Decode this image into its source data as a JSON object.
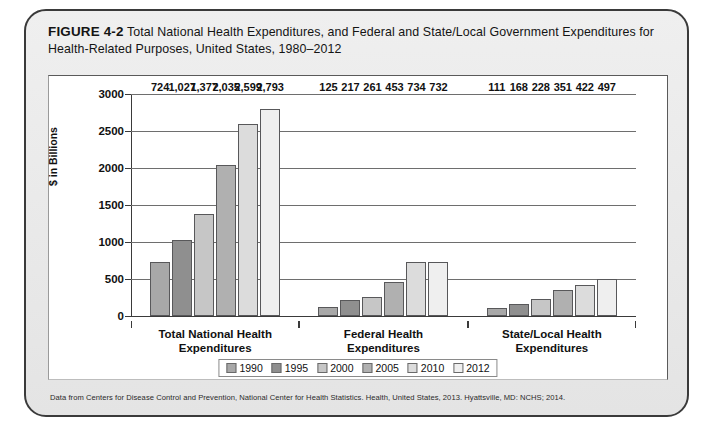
{
  "figure": {
    "label": "FIGURE 4-2",
    "caption": "Total National Health Expenditures, and Federal and State/Local Government Expenditures for Health-Related Purposes, United States, 1980–2012",
    "footnote": "Data from Centers for Disease Control and Prevention, National Center for Health Statistics. Health, United States, 2013. Hyattsville, MD: NCHS; 2014."
  },
  "chart_data": {
    "type": "bar",
    "title": "Total National Health Expenditures, and Federal and State/Local Government Expenditures for Health-Related Purposes, United States, 1980–2012",
    "xlabel": "",
    "ylabel": "$ in Billions",
    "ylim": [
      0,
      3000
    ],
    "yticks": [
      0,
      500,
      1000,
      1500,
      2000,
      2500,
      3000
    ],
    "ytick_labels": [
      "0",
      "500",
      "1000",
      "1500",
      "2000",
      "2500",
      "3000"
    ],
    "grid": true,
    "legend_position": "bottom",
    "categories": [
      "Total National Health Expenditures",
      "Federal Health Expenditures",
      "State/Local Health Expenditures"
    ],
    "series": [
      {
        "name": "1990",
        "color": "#a8a8a8",
        "values": [
          724,
          125,
          111
        ],
        "labels": [
          "724",
          "125",
          "111"
        ]
      },
      {
        "name": "1995",
        "color": "#8f8f8f",
        "values": [
          1027,
          217,
          168
        ],
        "labels": [
          "1,027",
          "217",
          "168"
        ]
      },
      {
        "name": "2000",
        "color": "#c6c6c6",
        "values": [
          1377,
          261,
          228
        ],
        "labels": [
          "1,377",
          "261",
          "228"
        ]
      },
      {
        "name": "2005",
        "color": "#b0b0b0",
        "values": [
          2035,
          453,
          351
        ],
        "labels": [
          "2,035",
          "453",
          "351"
        ]
      },
      {
        "name": "2010",
        "color": "#dcdcdc",
        "values": [
          2599,
          734,
          422
        ],
        "labels": [
          "2,599",
          "734",
          "422"
        ]
      },
      {
        "name": "2012",
        "color": "#efefef",
        "values": [
          2793,
          732,
          497
        ],
        "labels": [
          "2,793",
          "732",
          "497"
        ]
      }
    ]
  }
}
